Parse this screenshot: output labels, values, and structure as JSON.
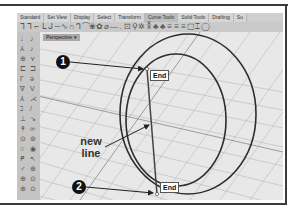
{
  "toolbar": {
    "tabs": [
      {
        "label": "Standard"
      },
      {
        "label": "Set View"
      },
      {
        "label": "Display"
      },
      {
        "label": "Select"
      },
      {
        "label": "Transform"
      },
      {
        "label": "Curve Tools",
        "active": true
      },
      {
        "label": "Solid Tools"
      },
      {
        "label": "Drafting"
      },
      {
        "label": "Su"
      }
    ]
  },
  "viewport": {
    "label": "Perspective",
    "dropdown_icon": "▾"
  },
  "snaps": {
    "start_label": "End",
    "end_label": "End"
  },
  "callouts": {
    "one": "1",
    "two": "2"
  },
  "annotation": {
    "line1": "new",
    "line2": "line"
  },
  "colors": {
    "curve": "#2e2e2e",
    "grid": "#b0b0b0",
    "viewport_bg": "#e8e8e8"
  }
}
